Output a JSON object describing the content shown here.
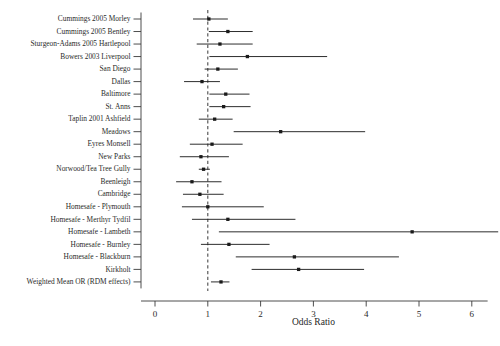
{
  "chart_data": {
    "type": "scatter",
    "subtype": "forest-plot",
    "title": "",
    "xlabel": "Odds Ratio",
    "ylabel": "",
    "xlim": [
      0,
      6.3
    ],
    "xticks": [
      0,
      1,
      2,
      3,
      4,
      5,
      6
    ],
    "xticklabels": [
      "0",
      "1",
      "2",
      "3",
      "4",
      "5",
      "6"
    ],
    "grid": false,
    "legend": null,
    "reference_line": 1.0,
    "reference_line_style": "dashed",
    "marker": "square",
    "marker_color": "#1a1a1a",
    "line_color": "#222222",
    "categories": [
      "Cummings 2005 Morley",
      "Cummings 2005 Bentley",
      "Sturgeon-Adams 2005 Hartlepool",
      "Bowers 2003 Liverpool",
      "San Diego",
      "Dallas",
      "Baltimore",
      "St. Anns",
      "Taplin 2001 Ashfield",
      "Meadows",
      "Eyres Monsell",
      "New Parks",
      "Norwood/Tea Tree Gully",
      "Beenleigh",
      "Cambridge",
      "Homesafe - Plymouth",
      "Homesafe - Merthyr Tydfil",
      "Homesafe - Lambeth",
      "Homesafe - Burnley",
      "Homesafe - Blackburn",
      "Kirkholt",
      "Weighted Mean OR (RDM effects)"
    ],
    "points": [
      {
        "label": "Cummings 2005 Morley",
        "or": 1.02,
        "ci_low": 0.72,
        "ci_high": 1.38
      },
      {
        "label": "Cummings 2005 Bentley",
        "or": 1.38,
        "ci_low": 1.02,
        "ci_high": 1.85
      },
      {
        "label": "Sturgeon-Adams 2005 Hartlepool",
        "or": 1.23,
        "ci_low": 0.79,
        "ci_high": 1.85
      },
      {
        "label": "Bowers 2003 Liverpool",
        "or": 1.75,
        "ci_low": 1.03,
        "ci_high": 3.26
      },
      {
        "label": "San Diego",
        "or": 1.19,
        "ci_low": 0.94,
        "ci_high": 1.57
      },
      {
        "label": "Dallas",
        "or": 0.89,
        "ci_low": 0.55,
        "ci_high": 1.23
      },
      {
        "label": "Baltimore",
        "or": 1.34,
        "ci_low": 1.03,
        "ci_high": 1.79
      },
      {
        "label": "St. Anns",
        "or": 1.3,
        "ci_low": 1.03,
        "ci_high": 1.81
      },
      {
        "label": "Taplin 2001 Ashfield",
        "or": 1.13,
        "ci_low": 0.83,
        "ci_high": 1.47
      },
      {
        "label": "Meadows",
        "or": 2.38,
        "ci_low": 1.49,
        "ci_high": 3.98
      },
      {
        "label": "Eyres Monsell",
        "or": 1.08,
        "ci_low": 0.66,
        "ci_high": 1.66
      },
      {
        "label": "New Parks",
        "or": 0.87,
        "ci_low": 0.47,
        "ci_high": 1.4
      },
      {
        "label": "Norwood/Tea Tree Gully",
        "or": 0.92,
        "ci_low": 0.83,
        "ci_high": 1.04
      },
      {
        "label": "Beenleigh",
        "or": 0.7,
        "ci_low": 0.4,
        "ci_high": 1.26
      },
      {
        "label": "Cambridge",
        "or": 0.85,
        "ci_low": 0.53,
        "ci_high": 1.3
      },
      {
        "label": "Homesafe - Plymouth",
        "or": 1.0,
        "ci_low": 0.51,
        "ci_high": 2.06
      },
      {
        "label": "Homesafe - Merthyr Tydfil",
        "or": 1.38,
        "ci_low": 0.7,
        "ci_high": 2.66
      },
      {
        "label": "Homesafe - Lambeth",
        "or": 4.87,
        "ci_low": 1.21,
        "ci_high": 6.5
      },
      {
        "label": "Homesafe - Burnley",
        "or": 1.4,
        "ci_low": 0.87,
        "ci_high": 2.17
      },
      {
        "label": "Homesafe - Blackburn",
        "or": 2.64,
        "ci_low": 1.53,
        "ci_high": 4.62
      },
      {
        "label": "Kirkholt",
        "or": 2.72,
        "ci_low": 1.83,
        "ci_high": 3.96
      },
      {
        "label": "Weighted Mean OR (RDM effects)",
        "or": 1.25,
        "ci_low": 1.06,
        "ci_high": 1.41
      }
    ]
  },
  "axis": {
    "x_title": "Odds Ratio"
  }
}
